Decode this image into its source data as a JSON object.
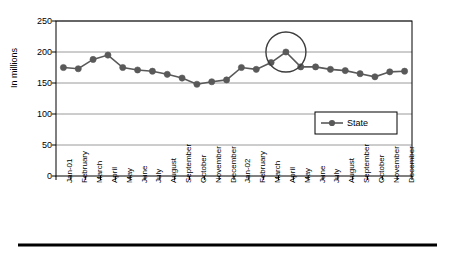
{
  "chart_data": {
    "type": "line",
    "title": "",
    "xlabel": "",
    "ylabel": "In millions",
    "ylim": [
      0,
      250
    ],
    "yticks": [
      0,
      50,
      100,
      150,
      200,
      250
    ],
    "grid": true,
    "legend_position": "inside-right",
    "categories": [
      "Jan-01",
      "February",
      "March",
      "April",
      "May",
      "June",
      "July",
      "August",
      "September",
      "October",
      "November",
      "December",
      "Jan-02",
      "February",
      "March",
      "April",
      "May",
      "June",
      "July",
      "August",
      "September",
      "October",
      "November",
      "December"
    ],
    "series": [
      {
        "name": "State",
        "color": "#595959",
        "marker": "circle",
        "values": [
          175,
          173,
          188,
          195,
          175,
          171,
          169,
          164,
          158,
          148,
          152,
          155,
          175,
          172,
          183,
          200,
          176,
          176,
          172,
          170,
          165,
          160,
          168,
          169
        ]
      }
    ],
    "annotations": [
      {
        "type": "circle",
        "label": "highlight-april-2002-peak",
        "target_category": "April",
        "target_index": 15,
        "target_value": 200,
        "color": "#3d3d3d"
      }
    ]
  },
  "legend": {
    "entries": [
      {
        "label": "State"
      }
    ]
  },
  "footer": {
    "rule": "horizontal-rule"
  }
}
